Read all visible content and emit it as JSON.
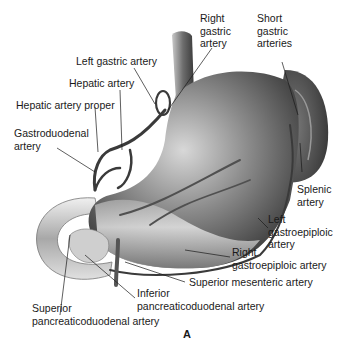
{
  "figure": {
    "panel_label": "A",
    "labels": {
      "right_gastric_artery": [
        "Right",
        "gastric",
        "artery"
      ],
      "short_gastric_arteries": [
        "Short",
        "gastric",
        "arteries"
      ],
      "left_gastric_artery": "Left gastric artery",
      "hepatic_artery": "Hepatic artery",
      "hepatic_artery_proper": "Hepatic artery proper",
      "gastroduodenal_artery": [
        "Gastroduodenal",
        "artery"
      ],
      "splenic_artery": [
        "Splenic",
        "artery"
      ],
      "left_gastroepiploic_artery": [
        "Left",
        "gastroepiploic",
        "artery"
      ],
      "right_gastroepiploic_artery": [
        "Right",
        "gastroepiploic artery"
      ],
      "superior_mesenteric_artery": "Superior mesenteric artery",
      "inferior_pancreaticoduodenal_artery": [
        "Inferior",
        "pancreaticoduodenal artery"
      ],
      "superior_pancreaticoduodenal_artery": [
        "Superior",
        "pancreaticoduodenal artery"
      ]
    }
  }
}
